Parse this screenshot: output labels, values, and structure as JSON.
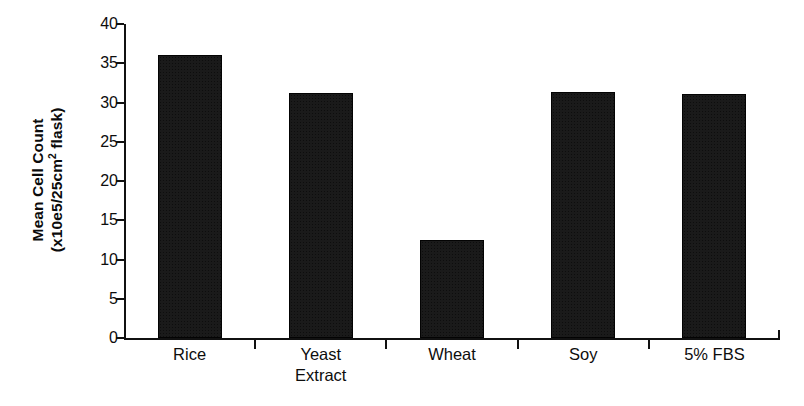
{
  "chart_data": {
    "type": "bar",
    "title": "",
    "subtitle": "",
    "xlabel": "",
    "ylabel": "Mean Cell Count (x10e5/25cm2 flask)",
    "ylabel_line1": "Mean Cell Count",
    "ylabel_line2_prefix": "(x10e5/25cm",
    "ylabel_line2_sup": "2",
    "ylabel_line2_suffix": " flask)",
    "categories": [
      "Rice",
      "Yeast Extract",
      "Wheat",
      "Soy",
      "5% FBS"
    ],
    "category_lines": [
      [
        "Rice"
      ],
      [
        "Yeast",
        "Extract"
      ],
      [
        "Wheat"
      ],
      [
        "Soy"
      ],
      [
        "5% FBS"
      ]
    ],
    "values": [
      36.0,
      31.2,
      12.5,
      31.4,
      31.1
    ],
    "ylim": [
      0,
      40
    ],
    "ytick_values": [
      40,
      35,
      30,
      25,
      20,
      15,
      10,
      5,
      0
    ],
    "ytick_labels": [
      "40",
      "35",
      "30",
      "25",
      "20",
      "15",
      "10",
      "5",
      "0"
    ],
    "ytick_step": 5,
    "grid": false,
    "legend": false,
    "legend_position": "none",
    "bar_color": "#1a1a1a",
    "axis_color": "#111111",
    "background_color": "#ffffff"
  }
}
